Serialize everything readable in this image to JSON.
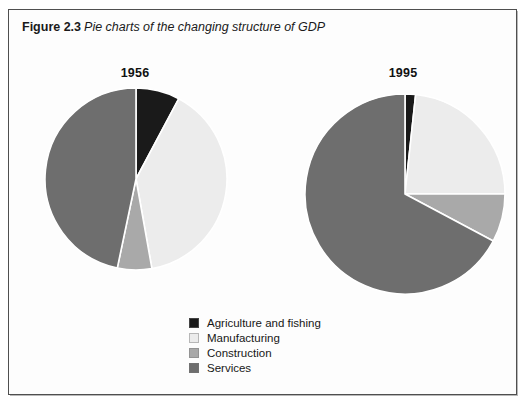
{
  "figure": {
    "number": "Figure 2.3",
    "caption": "Pie charts of the changing structure of GDP"
  },
  "legend": {
    "items": [
      {
        "label": "Agriculture and fishing",
        "color": "#1a1a1a"
      },
      {
        "label": "Manufacturing",
        "color": "#ececec"
      },
      {
        "label": "Construction",
        "color": "#a9a9a9"
      },
      {
        "label": "Services",
        "color": "#6e6e6e"
      }
    ]
  },
  "chart_data": [
    {
      "type": "pie",
      "title": "1956",
      "categories": [
        "Agriculture and fishing",
        "Manufacturing",
        "Construction",
        "Services"
      ],
      "values": [
        7.8,
        39.4,
        6.1,
        46.7
      ],
      "colors": [
        "#1a1a1a",
        "#ececec",
        "#a9a9a9",
        "#6e6e6e"
      ],
      "start_angle_deg": 0,
      "direction": "clockwise",
      "radius_px": 91,
      "center": [
        101,
        95
      ],
      "xlabel": "",
      "ylabel": "",
      "grid": false,
      "legend_position": "bottom-center"
    },
    {
      "type": "pie",
      "title": "1995",
      "categories": [
        "Agriculture and fishing",
        "Manufacturing",
        "Construction",
        "Services"
      ],
      "values": [
        1.7,
        23.3,
        7.8,
        67.2
      ],
      "colors": [
        "#1a1a1a",
        "#ececec",
        "#a9a9a9",
        "#6e6e6e"
      ],
      "start_angle_deg": 0,
      "direction": "clockwise",
      "radius_px": 100,
      "center": [
        109,
        110
      ],
      "xlabel": "",
      "ylabel": "",
      "grid": false,
      "legend_position": "bottom-center"
    }
  ]
}
